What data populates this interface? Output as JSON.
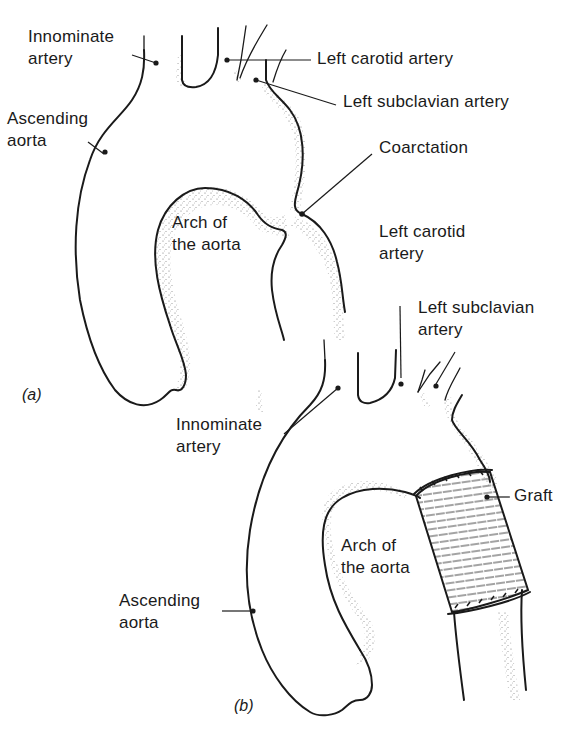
{
  "figure": {
    "panel_a": {
      "tag": "(a)",
      "labels": {
        "innominate_line1": "Innominate",
        "innominate_line2": "artery",
        "ascending_line1": "Ascending",
        "ascending_line2": "aorta",
        "left_carotid": "Left carotid artery",
        "left_subclavian": "Left subclavian artery",
        "coarctation": "Coarctation",
        "arch_line1": "Arch of",
        "arch_line2": "the aorta"
      }
    },
    "panel_b": {
      "tag": "(b)",
      "labels": {
        "left_carotid_line1": "Left carotid",
        "left_carotid_line2": "artery",
        "left_subclavian_line1": "Left subclavian",
        "left_subclavian_line2": "artery",
        "innominate_line1": "Innominate",
        "innominate_line2": "artery",
        "graft": "Graft",
        "arch_line1": "Arch of",
        "arch_line2": "the aorta",
        "ascending_line1": "Ascending",
        "ascending_line2": "aorta"
      }
    }
  }
}
